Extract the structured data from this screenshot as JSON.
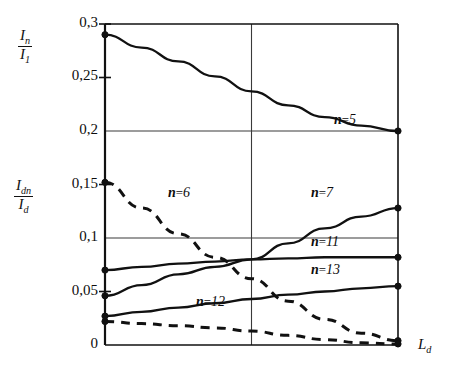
{
  "chart_data": {
    "type": "line",
    "title": "",
    "xlabel": "L_d",
    "ylabel_top": "I_n / I_1",
    "ylabel_bottom": "I_dn / I_d",
    "xlim": [
      0,
      2
    ],
    "ylim": [
      0,
      0.3
    ],
    "grid": true,
    "x_ticks": [],
    "y_ticks": [
      0,
      0.05,
      0.1,
      0.15,
      0.2,
      0.25,
      0.3
    ],
    "y_tick_labels": [
      "0",
      "0,05",
      "0,1",
      "0,15",
      "0,2",
      "0,25",
      "0,3"
    ],
    "legend_position": "inline-annotations",
    "series": [
      {
        "name": "n=5",
        "label": "n=5",
        "style": "solid",
        "x": [
          0,
          0.25,
          0.5,
          0.75,
          1.0,
          1.25,
          1.5,
          1.75,
          2.0
        ],
        "values": [
          0.29,
          0.278,
          0.265,
          0.251,
          0.237,
          0.224,
          0.213,
          0.205,
          0.2
        ],
        "endpoint_marker": true
      },
      {
        "name": "n=6",
        "label": "n=6",
        "style": "dashed",
        "x": [
          0,
          0.25,
          0.5,
          0.75,
          1.0,
          1.25,
          1.5,
          1.75,
          2.0
        ],
        "values": [
          0.152,
          0.128,
          0.104,
          0.082,
          0.062,
          0.041,
          0.024,
          0.011,
          0.004
        ],
        "endpoint_marker": true
      },
      {
        "name": "n=7",
        "label": "n=7",
        "style": "solid",
        "x": [
          0,
          0.25,
          0.5,
          0.75,
          1.0,
          1.25,
          1.5,
          1.75,
          2.0
        ],
        "values": [
          0.046,
          0.056,
          0.066,
          0.073,
          0.08,
          0.095,
          0.109,
          0.12,
          0.128
        ],
        "endpoint_marker": true
      },
      {
        "name": "n=11",
        "label": "n=11",
        "style": "solid",
        "x": [
          0,
          0.25,
          0.5,
          0.75,
          1.0,
          1.25,
          1.5,
          1.75,
          2.0
        ],
        "values": [
          0.07,
          0.073,
          0.076,
          0.078,
          0.08,
          0.081,
          0.082,
          0.082,
          0.082
        ],
        "endpoint_marker": true
      },
      {
        "name": "n=12",
        "label": "n=12",
        "style": "dashed",
        "x": [
          0,
          0.25,
          0.5,
          0.75,
          1.0,
          1.25,
          1.5,
          1.75,
          2.0
        ],
        "values": [
          0.022,
          0.02,
          0.018,
          0.016,
          0.013,
          0.009,
          0.005,
          0.002,
          0.001
        ],
        "endpoint_marker": true
      },
      {
        "name": "n=13",
        "label": "n=13",
        "style": "solid",
        "x": [
          0,
          0.25,
          0.5,
          0.75,
          1.0,
          1.25,
          1.5,
          1.75,
          2.0
        ],
        "values": [
          0.027,
          0.031,
          0.035,
          0.039,
          0.043,
          0.047,
          0.05,
          0.053,
          0.055
        ],
        "endpoint_marker": true
      }
    ],
    "annotations": [
      {
        "text": "n=5",
        "x": 334,
        "y": 112
      },
      {
        "text": "n=6",
        "x": 168,
        "y": 185
      },
      {
        "text": "n=7",
        "x": 311,
        "y": 185
      },
      {
        "text": "n=11",
        "x": 311,
        "y": 234
      },
      {
        "text": "n=13",
        "x": 311,
        "y": 262
      },
      {
        "text": "n=12",
        "x": 196,
        "y": 294
      }
    ]
  },
  "axis_labels": {
    "top_numerator": "I",
    "top_numerator_sub": "n",
    "top_denominator": "I",
    "top_denominator_sub": "1",
    "bottom_numerator": "I",
    "bottom_numerator_sub": "dn",
    "bottom_denominator": "I",
    "bottom_denominator_sub": "d",
    "x_axis": "L",
    "x_axis_sub": "d"
  },
  "ticks": {
    "labels": [
      "0,3",
      "0,25",
      "0,2",
      "0,15",
      "0,1",
      "0,05",
      "0"
    ]
  },
  "colors": {
    "ink": "#111111",
    "grid": "#3a3a3a",
    "background": "#ffffff"
  }
}
